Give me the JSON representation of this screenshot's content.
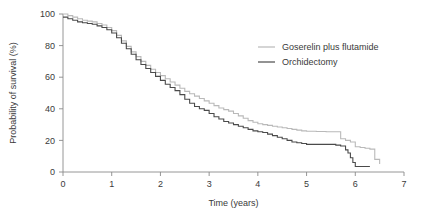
{
  "chart_data": {
    "type": "line",
    "title": "",
    "subtitle": "",
    "xlabel": "Time (years)",
    "ylabel": "Probability of survival (%)",
    "xlim": [
      0,
      7
    ],
    "ylim": [
      0,
      100
    ],
    "xticks": [
      "0",
      "1",
      "2",
      "3",
      "4",
      "5",
      "6",
      "7"
    ],
    "xtick_values": [
      0,
      1,
      2,
      3,
      4,
      5,
      6,
      7
    ],
    "yticks": [
      "0",
      "20",
      "40",
      "60",
      "80",
      "100"
    ],
    "ytick_values": [
      0,
      20,
      40,
      60,
      80,
      100
    ],
    "grid": false,
    "legend_position": "upper-right",
    "step_style": "post",
    "annotations": [],
    "series": [
      {
        "name": "Goserelin plus flutamide",
        "color": "#b9b9b9",
        "x": [
          0.0,
          0.1,
          0.2,
          0.3,
          0.4,
          0.5,
          0.6,
          0.7,
          0.8,
          0.9,
          1.0,
          1.1,
          1.2,
          1.3,
          1.4,
          1.5,
          1.6,
          1.7,
          1.8,
          1.9,
          2.0,
          2.1,
          2.2,
          2.3,
          2.4,
          2.5,
          2.6,
          2.7,
          2.8,
          2.9,
          3.0,
          3.1,
          3.2,
          3.3,
          3.4,
          3.5,
          3.6,
          3.7,
          3.8,
          3.9,
          4.0,
          4.1,
          4.2,
          4.3,
          4.4,
          4.5,
          4.6,
          4.7,
          4.8,
          4.9,
          5.0,
          5.2,
          5.4,
          5.6,
          5.7,
          5.8,
          5.9,
          6.0,
          6.1,
          6.2,
          6.3,
          6.4,
          6.5
        ],
        "y": [
          100.0,
          99.0,
          98.0,
          97.0,
          96.0,
          95.5,
          95.0,
          94.0,
          93.0,
          91.5,
          89.5,
          86.5,
          83.0,
          79.5,
          76.0,
          73.0,
          70.0,
          67.5,
          65.0,
          63.0,
          61.0,
          59.0,
          57.0,
          55.0,
          53.0,
          51.0,
          49.5,
          48.0,
          46.5,
          45.0,
          43.5,
          42.0,
          40.5,
          39.5,
          38.5,
          37.0,
          35.5,
          34.0,
          32.5,
          31.5,
          30.5,
          30.0,
          29.5,
          29.0,
          28.5,
          28.0,
          27.5,
          27.0,
          26.5,
          26.0,
          25.8,
          25.6,
          25.5,
          25.5,
          21.0,
          20.0,
          19.0,
          16.0,
          15.5,
          15.0,
          14.5,
          8.0,
          5.0
        ]
      },
      {
        "name": "Orchidectomy",
        "color": "#4a4a4a",
        "x": [
          0.0,
          0.1,
          0.2,
          0.3,
          0.4,
          0.5,
          0.6,
          0.7,
          0.8,
          0.9,
          1.0,
          1.1,
          1.2,
          1.3,
          1.4,
          1.5,
          1.6,
          1.7,
          1.8,
          1.9,
          2.0,
          2.1,
          2.2,
          2.3,
          2.4,
          2.5,
          2.6,
          2.7,
          2.8,
          2.9,
          3.0,
          3.1,
          3.2,
          3.3,
          3.4,
          3.5,
          3.6,
          3.7,
          3.8,
          3.9,
          4.0,
          4.1,
          4.2,
          4.3,
          4.4,
          4.5,
          4.6,
          4.7,
          4.8,
          4.9,
          5.0,
          5.2,
          5.4,
          5.5,
          5.6,
          5.7,
          5.8,
          5.85,
          5.9,
          5.95,
          6.0,
          6.1,
          6.2,
          6.3
        ],
        "y": [
          98.0,
          97.0,
          96.0,
          95.0,
          94.5,
          94.0,
          93.5,
          92.5,
          91.5,
          90.0,
          88.0,
          85.0,
          81.5,
          78.0,
          74.5,
          71.0,
          68.0,
          65.5,
          63.0,
          60.5,
          58.0,
          55.5,
          53.5,
          51.5,
          49.0,
          46.0,
          43.5,
          41.5,
          40.0,
          39.0,
          37.0,
          35.0,
          33.5,
          32.0,
          31.0,
          30.0,
          29.0,
          28.0,
          27.0,
          26.0,
          25.5,
          25.0,
          24.0,
          23.0,
          22.0,
          21.0,
          20.0,
          19.0,
          18.5,
          18.0,
          17.5,
          17.5,
          17.5,
          17.5,
          17.0,
          16.5,
          14.0,
          12.0,
          9.0,
          6.0,
          3.5,
          3.5,
          3.5,
          3.5
        ]
      }
    ]
  },
  "legend": {
    "entries": [
      {
        "label": "Goserelin plus flutamide",
        "color": "#b9b9b9"
      },
      {
        "label": "Orchidectomy",
        "color": "#4a4a4a"
      }
    ]
  },
  "axes": {
    "x_title": "Time (years)",
    "y_title": "Probability of survival (%)"
  },
  "colors": {
    "axis": "#8a8a8a",
    "text": "#3a3a3a",
    "series_light": "#b9b9b9",
    "series_dark": "#4a4a4a",
    "background": "#ffffff"
  }
}
